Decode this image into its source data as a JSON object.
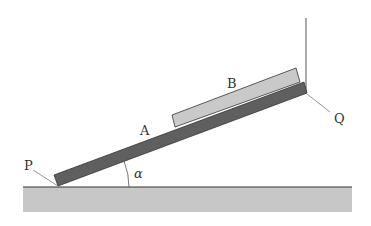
{
  "diagram": {
    "labels": {
      "plank": "A",
      "block": "B",
      "lower_end": "P",
      "upper_end": "Q",
      "angle": "α"
    },
    "colors": {
      "plank_fill": "#5f5f5f",
      "block_fill": "#c9c9c9",
      "ground_fill": "#c7c7c7",
      "outline": "#333333",
      "leader_line": "#7a7a7a"
    }
  }
}
